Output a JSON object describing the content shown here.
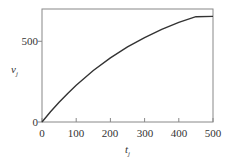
{
  "chart_data": {
    "type": "line",
    "title": "",
    "xlabel": "t",
    "xlabel_subscript": "j",
    "ylabel": "v",
    "ylabel_subscript": "j",
    "xlim": [
      0,
      500
    ],
    "ylim": [
      0,
      700
    ],
    "xticks": [
      0,
      100,
      200,
      300,
      400,
      500
    ],
    "yticks": [
      0,
      500
    ],
    "xtick_labels": [
      "0",
      "100",
      "200",
      "300",
      "400",
      "500"
    ],
    "ytick_labels": [
      "0",
      "500"
    ],
    "grid": false,
    "legend": null,
    "series": [
      {
        "name": "v_j",
        "color": "#333333",
        "x": [
          0,
          25,
          50,
          75,
          100,
          150,
          200,
          250,
          300,
          350,
          400,
          450,
          500
        ],
        "y": [
          0,
          63,
          122,
          177,
          228,
          319,
          397,
          465,
          523,
          574,
          617,
          652,
          654
        ]
      }
    ]
  },
  "labels": {
    "x_axis": "t",
    "x_axis_sub": "j",
    "y_axis": "v",
    "y_axis_sub": "j",
    "xticks": [
      "0",
      "100",
      "200",
      "300",
      "400",
      "500"
    ],
    "yticks": [
      "0",
      "500"
    ]
  }
}
